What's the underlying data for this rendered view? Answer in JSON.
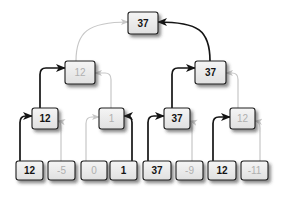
{
  "canvas": {
    "width": 291,
    "height": 199,
    "background": "#ffffff"
  },
  "diagram": {
    "type": "binary-tree",
    "colors": {
      "node_fill_top": "#f5f5f5",
      "node_fill_bottom": "#e0e0e0",
      "node_border": "#1e1e1e",
      "winner_text": "#141414",
      "loser_text": "#b0b0b0",
      "winner_edge": "#141414",
      "loser_edge": "#c7c7c7",
      "shadow": "#2e2e2e"
    },
    "nodes": [
      {
        "id": "root",
        "value": "37",
        "x": 128,
        "y": 12,
        "w": 30,
        "h": 22,
        "emph": true
      },
      {
        "id": "n10",
        "value": "12",
        "x": 65,
        "y": 61,
        "w": 30,
        "h": 23,
        "emph": false
      },
      {
        "id": "n11",
        "value": "37",
        "x": 195,
        "y": 61,
        "w": 31,
        "h": 23,
        "emph": true
      },
      {
        "id": "n20",
        "value": "12",
        "x": 32,
        "y": 108,
        "w": 26,
        "h": 21,
        "emph": true
      },
      {
        "id": "n21",
        "value": "1",
        "x": 99,
        "y": 108,
        "w": 25,
        "h": 21,
        "emph": false
      },
      {
        "id": "n22",
        "value": "37",
        "x": 164,
        "y": 108,
        "w": 26,
        "h": 21,
        "emph": true
      },
      {
        "id": "n23",
        "value": "12",
        "x": 230,
        "y": 108,
        "w": 25,
        "h": 21,
        "emph": false
      },
      {
        "id": "l0",
        "value": "12",
        "x": 16,
        "y": 161,
        "w": 27,
        "h": 19,
        "emph": true
      },
      {
        "id": "l1",
        "value": "-5",
        "x": 48,
        "y": 161,
        "w": 27,
        "h": 19,
        "emph": false
      },
      {
        "id": "l2",
        "value": "0",
        "x": 81,
        "y": 161,
        "w": 26,
        "h": 19,
        "emph": false
      },
      {
        "id": "l3",
        "value": "1",
        "x": 110,
        "y": 161,
        "w": 27,
        "h": 19,
        "emph": true
      },
      {
        "id": "l4",
        "value": "37",
        "x": 143,
        "y": 161,
        "w": 28,
        "h": 19,
        "emph": true
      },
      {
        "id": "l5",
        "value": "-9",
        "x": 176,
        "y": 161,
        "w": 27,
        "h": 19,
        "emph": false
      },
      {
        "id": "l6",
        "value": "12",
        "x": 208,
        "y": 161,
        "w": 28,
        "h": 19,
        "emph": true
      },
      {
        "id": "l7",
        "value": "-11",
        "x": 241,
        "y": 161,
        "w": 27,
        "h": 19,
        "emph": false
      }
    ],
    "edges": [
      {
        "from": "l0",
        "to": "n20",
        "winner": true,
        "path": "M20,161 V122.5 Q20,116 26,116 H32"
      },
      {
        "from": "l1",
        "to": "n20",
        "winner": false,
        "path": "M61,161 V128 Q61,121.5 58,121"
      },
      {
        "from": "l2",
        "to": "n21",
        "winner": false,
        "path": "M86,161 V123.5 Q86,117 92,117 H99"
      },
      {
        "from": "l3",
        "to": "n21",
        "winner": true,
        "path": "M132,161 V122.5 Q132,116 126,116 H124"
      },
      {
        "from": "l4",
        "to": "n22",
        "winner": true,
        "path": "M148,161 V122.5 Q148,116 154,116 H164"
      },
      {
        "from": "l5",
        "to": "n22",
        "winner": false,
        "path": "M192,161 V128 Q192,121.5 190,121"
      },
      {
        "from": "l6",
        "to": "n23",
        "winner": true,
        "path": "M213,161 V123.5 Q213,117 219,117 H230"
      },
      {
        "from": "l7",
        "to": "n23",
        "winner": false,
        "path": "M260,161 V128 Q260,121.5 255,121"
      },
      {
        "from": "n20",
        "to": "n10",
        "winner": true,
        "path": "M40,108 V74.5 Q40,68 46,68 H65"
      },
      {
        "from": "n21",
        "to": "n10",
        "winner": false,
        "path": "M111,108 V79.5 Q111,73 105,73 H95"
      },
      {
        "from": "n22",
        "to": "n11",
        "winner": true,
        "path": "M172,108 V74.5 Q172,68 178,68 H195"
      },
      {
        "from": "n23",
        "to": "n11",
        "winner": false,
        "path": "M238,108 V79.5 Q238,73 232,73 H226"
      },
      {
        "from": "n10",
        "to": "root",
        "winner": false,
        "path": "M76,61 C76,32 88,22 128,22"
      },
      {
        "from": "n11",
        "to": "root",
        "winner": true,
        "path": "M210,61 C210,30 198,22 158,22"
      }
    ]
  }
}
